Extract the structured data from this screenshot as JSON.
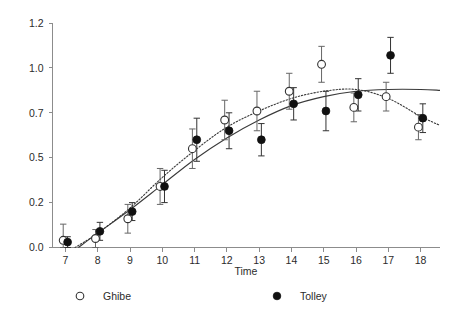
{
  "chart_data": {
    "type": "scatter",
    "title": "",
    "xlabel": "Time",
    "ylabel": "",
    "xlim": [
      6.6,
      18.6
    ],
    "ylim": [
      0.0,
      1.25
    ],
    "grid": false,
    "legend_position": "bottom",
    "x_ticks": [
      7,
      8,
      9,
      10,
      11,
      12,
      13,
      14,
      15,
      16,
      17,
      18
    ],
    "x_tick_labels": [
      "7",
      "8",
      "9",
      "10",
      "11",
      "12",
      "13",
      "14",
      "15",
      "16",
      "17",
      "18"
    ],
    "y_ticks": [
      0.0,
      0.25,
      0.5,
      0.75,
      1.0,
      1.25
    ],
    "y_tick_labels": [
      "0.0",
      "0.2",
      "0.5",
      "0.7",
      "1.0",
      "1.2"
    ],
    "series": [
      {
        "name": "Ghibe",
        "marker": "open-circle",
        "fit_line_style": "dotted",
        "x": [
          7,
          8,
          9,
          10,
          11,
          12,
          13,
          14,
          15,
          16,
          17,
          18
        ],
        "values": [
          0.04,
          0.05,
          0.16,
          0.34,
          0.55,
          0.71,
          0.76,
          0.87,
          1.02,
          0.78,
          0.84,
          0.67
        ],
        "err_low": [
          0.04,
          0.05,
          0.08,
          0.1,
          0.11,
          0.11,
          0.11,
          0.1,
          0.1,
          0.08,
          0.08,
          0.07
        ],
        "err_high": [
          0.09,
          0.05,
          0.08,
          0.1,
          0.11,
          0.11,
          0.11,
          0.1,
          0.1,
          0.08,
          0.08,
          0.07
        ],
        "fit_curve": [
          [
            7.3,
            0.0
          ],
          [
            8,
            0.08
          ],
          [
            9,
            0.22
          ],
          [
            10,
            0.39
          ],
          [
            11,
            0.54
          ],
          [
            12,
            0.67
          ],
          [
            13,
            0.76
          ],
          [
            14,
            0.83
          ],
          [
            15,
            0.87
          ],
          [
            16,
            0.88
          ],
          [
            17,
            0.83
          ],
          [
            18,
            0.73
          ],
          [
            18.6,
            0.68
          ]
        ]
      },
      {
        "name": "Tolley",
        "marker": "filled-circle",
        "fit_line_style": "solid",
        "x": [
          7,
          8,
          9,
          10,
          11,
          12,
          13,
          14,
          15,
          16,
          17,
          18
        ],
        "values": [
          0.03,
          0.09,
          0.2,
          0.34,
          0.6,
          0.65,
          0.6,
          0.8,
          0.76,
          0.85,
          1.07,
          0.72
        ],
        "err_low": [
          0.03,
          0.05,
          0.05,
          0.09,
          0.12,
          0.1,
          0.09,
          0.09,
          0.11,
          0.09,
          0.1,
          0.08
        ],
        "err_high": [
          0.03,
          0.05,
          0.05,
          0.09,
          0.12,
          0.1,
          0.09,
          0.09,
          0.11,
          0.09,
          0.1,
          0.08
        ],
        "fit_curve": [
          [
            7.4,
            0.0
          ],
          [
            8,
            0.08
          ],
          [
            9,
            0.21
          ],
          [
            10,
            0.35
          ],
          [
            11,
            0.49
          ],
          [
            12,
            0.61
          ],
          [
            13,
            0.71
          ],
          [
            14,
            0.79
          ],
          [
            15,
            0.84
          ],
          [
            16,
            0.87
          ],
          [
            17,
            0.88
          ],
          [
            18,
            0.88
          ],
          [
            18.6,
            0.875
          ]
        ]
      }
    ],
    "legend": [
      {
        "label": "Ghibe",
        "marker": "open-circle"
      },
      {
        "label": "Tolley",
        "marker": "filled-circle"
      }
    ]
  }
}
